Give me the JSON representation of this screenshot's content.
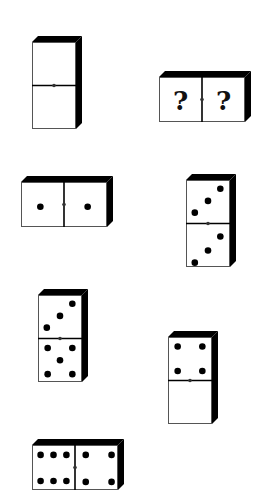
{
  "puzzle": {
    "title": "Domino sequence puzzle",
    "colors": {
      "face": "#ffffff",
      "edge": "#000000",
      "outline": "#555555",
      "pip": "#000000"
    },
    "dominoes": [
      {
        "id": "d1",
        "orientation": "vertical",
        "x": 32,
        "y": 42,
        "first": 0,
        "second": 0,
        "first_label": "",
        "second_label": ""
      },
      {
        "id": "d2",
        "orientation": "horizontal",
        "x": 159,
        "y": 77,
        "first": null,
        "second": null,
        "first_label": "?",
        "second_label": "?"
      },
      {
        "id": "d3",
        "orientation": "horizontal",
        "x": 21,
        "y": 182,
        "first": 1,
        "second": 1,
        "first_label": "",
        "second_label": ""
      },
      {
        "id": "d4",
        "orientation": "vertical",
        "x": 186,
        "y": 180,
        "first": 3,
        "second": 3,
        "first_label": "",
        "second_label": ""
      },
      {
        "id": "d5",
        "orientation": "vertical",
        "x": 38,
        "y": 295,
        "first": 3,
        "second": 5,
        "first_label": "",
        "second_label": ""
      },
      {
        "id": "d6",
        "orientation": "vertical",
        "x": 168,
        "y": 337,
        "first": 4,
        "second": 0,
        "first_label": "",
        "second_label": ""
      },
      {
        "id": "d7",
        "orientation": "horizontal",
        "x": 32,
        "y": 445,
        "first": 6,
        "second": 4,
        "first_label": "",
        "second_label": ""
      }
    ]
  }
}
